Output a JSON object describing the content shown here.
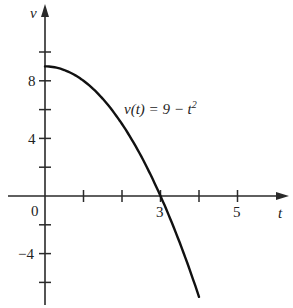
{
  "chart_data": {
    "type": "line",
    "title": "",
    "xlabel": "t",
    "ylabel": "v",
    "function": "v(t) = 9 - t^2",
    "annotation": {
      "text_prefix": "v(t) = 9 − t",
      "superscript": "2"
    },
    "x": [
      0,
      0.5,
      1,
      1.5,
      2,
      2.5,
      3,
      3.5,
      4
    ],
    "values": [
      9,
      8.75,
      8,
      6.75,
      5,
      2.75,
      0,
      -3.25,
      -7
    ],
    "xlim": [
      -1.1,
      6.3
    ],
    "ylim": [
      -7.8,
      10.5
    ],
    "x_ticks": [
      1,
      2,
      3,
      4,
      5
    ],
    "x_tick_labels": {
      "0": "0",
      "3": "3",
      "5": "5"
    },
    "y_ticks": [
      10,
      8,
      6,
      4,
      2,
      -2,
      -4,
      -6
    ],
    "y_tick_labels": {
      "8": "8",
      "4": "4",
      "-4": "−4"
    },
    "grid": false,
    "legend": null
  },
  "labels": {
    "origin": "0",
    "x3": "3",
    "x5": "5",
    "y8": "8",
    "y4": "4",
    "yneg4": "−4",
    "x_axis": "t",
    "y_axis": "v",
    "curve_prefix": "v(t) = 9 − t",
    "curve_sup": "2"
  },
  "colors": {
    "axis": "#2a2a2a",
    "curve": "#111111",
    "text": "#222222"
  }
}
